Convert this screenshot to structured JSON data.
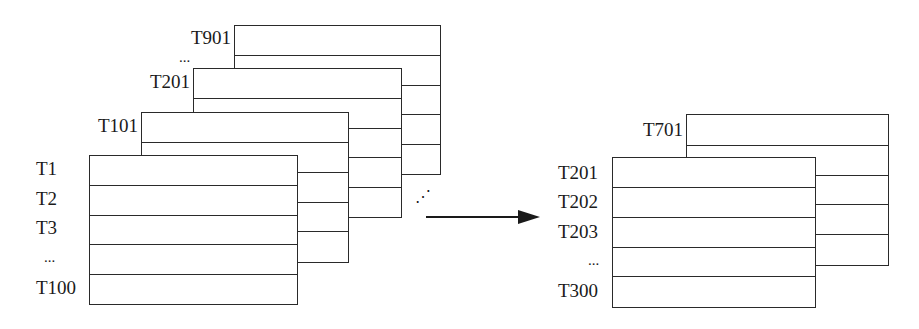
{
  "diagram": {
    "source_group": {
      "tables": [
        {
          "id": "t901",
          "first_label": "T901"
        },
        {
          "id": "t201",
          "first_label": "T201"
        },
        {
          "id": "t101",
          "first_label": "T101"
        },
        {
          "id": "t1",
          "row_labels": [
            "T1",
            "T2",
            "T3",
            "...",
            "T100"
          ]
        }
      ],
      "ellipsis_between_stacks": "...",
      "diagonal_ellipsis": "⋰"
    },
    "arrow": {
      "direction": "right"
    },
    "target_group": {
      "tables": [
        {
          "id": "t701",
          "first_label": "T701"
        },
        {
          "id": "t201b",
          "row_labels": [
            "T201",
            "T202",
            "T203",
            "...",
            "T300"
          ]
        }
      ]
    }
  }
}
